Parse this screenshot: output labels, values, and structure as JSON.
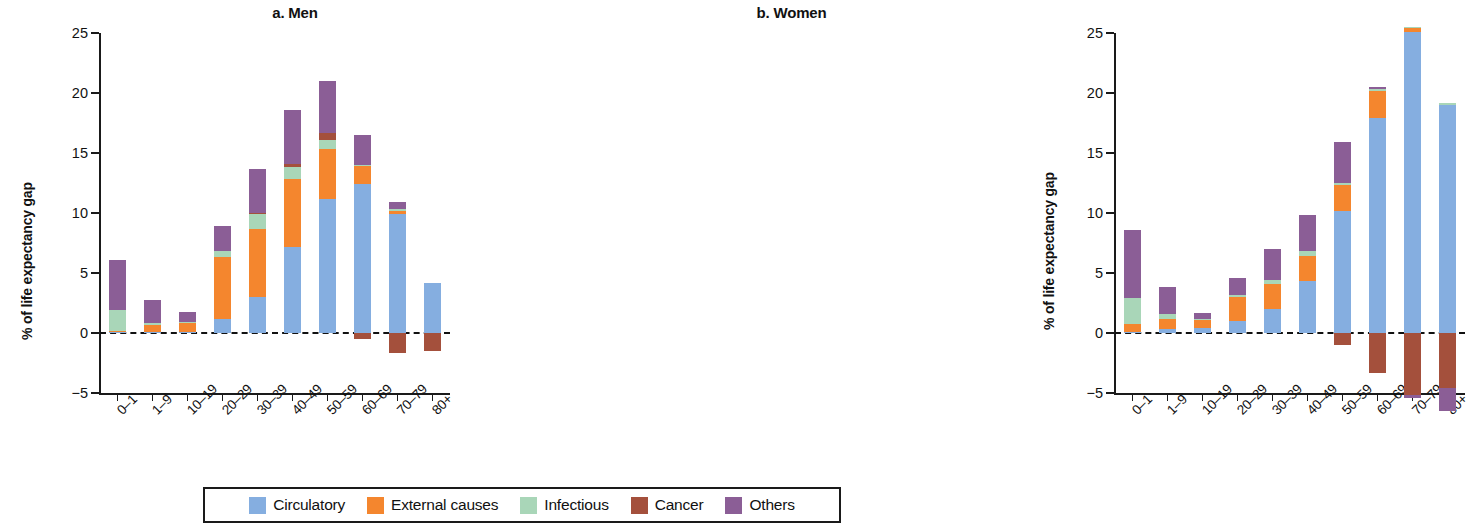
{
  "figure": {
    "ylabel": "% of life expectancy gap"
  },
  "legend": {
    "items": [
      {
        "label": "Circulatory",
        "key": "circulatory",
        "color": "#85AEE0"
      },
      {
        "label": "External causes",
        "key": "external",
        "color": "#F4862E"
      },
      {
        "label": "Infectious",
        "key": "infectious",
        "color": "#A9D6B8"
      },
      {
        "label": "Cancer",
        "key": "cancer",
        "color": "#A4503C"
      },
      {
        "label": "Others",
        "key": "others",
        "color": "#8B5E96"
      }
    ]
  },
  "chart_data": [
    {
      "type": "bar",
      "title": "a. Men",
      "stacked": true,
      "xlabel": "",
      "ylabel": "% of life expectancy gap",
      "ylim": [
        -5,
        25
      ],
      "yticks": [
        25,
        20,
        15,
        10,
        5,
        0,
        -5
      ],
      "yticklabels": [
        "25",
        "20",
        "15",
        "10",
        "5",
        "0",
        "−5"
      ],
      "grid": false,
      "zero_line": true,
      "legend_position": "bottom",
      "categories": [
        "0–1",
        "1–9",
        "10–19",
        "20–29",
        "30–39",
        "40–49",
        "50–59",
        "60–69",
        "70–79",
        "80+"
      ],
      "series": [
        {
          "name": "Circulatory",
          "color": "#85AEE0",
          "values": [
            0.05,
            0.05,
            0.05,
            1.2,
            3.0,
            7.2,
            11.2,
            12.4,
            9.9,
            4.2
          ]
        },
        {
          "name": "External causes",
          "color": "#F4862E",
          "values": [
            0.1,
            0.6,
            0.8,
            5.1,
            5.7,
            5.6,
            4.1,
            1.5,
            0.3,
            0.0
          ]
        },
        {
          "name": "Infectious",
          "color": "#A9D6B8",
          "values": [
            1.8,
            0.2,
            0.1,
            0.5,
            1.2,
            1.0,
            0.8,
            0.1,
            0.1,
            0.0
          ]
        },
        {
          "name": "Cancer",
          "color": "#A4503C",
          "values": [
            0.0,
            0.0,
            0.0,
            0.0,
            0.1,
            0.3,
            0.6,
            -0.5,
            -1.7,
            -1.5
          ]
        },
        {
          "name": "Others",
          "color": "#8B5E96",
          "values": [
            4.1,
            1.9,
            0.8,
            2.1,
            3.7,
            4.5,
            4.3,
            2.5,
            0.6,
            0.0
          ]
        }
      ],
      "totals_positive": [
        6.05,
        2.85,
        1.75,
        8.9,
        13.7,
        18.6,
        21.0,
        16.5,
        10.9,
        4.2
      ]
    },
    {
      "type": "bar",
      "title": "b. Women",
      "stacked": true,
      "xlabel": "",
      "ylabel": "% of life expectancy gap",
      "ylim": [
        -5,
        25
      ],
      "yticks": [
        25,
        20,
        15,
        10,
        5,
        0,
        -5
      ],
      "yticklabels": [
        "25",
        "20",
        "15",
        "10",
        "5",
        "0",
        "−5"
      ],
      "grid": false,
      "zero_line": true,
      "legend_position": "bottom",
      "categories": [
        "0–1",
        "1–9",
        "10–19",
        "20–29",
        "30–39",
        "40–49",
        "50–59",
        "60–69",
        "70–79",
        "80+"
      ],
      "series": [
        {
          "name": "Circulatory",
          "color": "#85AEE0",
          "values": [
            0.05,
            0.3,
            0.4,
            1.0,
            2.0,
            4.3,
            10.2,
            17.9,
            25.1,
            19.0
          ]
        },
        {
          "name": "External causes",
          "color": "#F4862E",
          "values": [
            0.7,
            0.9,
            0.7,
            2.0,
            2.1,
            2.1,
            2.1,
            2.3,
            0.3,
            0.0
          ]
        },
        {
          "name": "Infectious",
          "color": "#A9D6B8",
          "values": [
            2.2,
            0.4,
            0.1,
            0.2,
            0.3,
            0.4,
            0.2,
            0.1,
            0.1,
            0.2
          ]
        },
        {
          "name": "Cancer",
          "color": "#A4503C",
          "values": [
            0.0,
            0.0,
            0.0,
            0.0,
            0.0,
            0.0,
            -1.0,
            -3.3,
            -5.2,
            -4.6
          ]
        },
        {
          "name": "Others",
          "color": "#8B5E96",
          "values": [
            5.6,
            2.2,
            0.5,
            1.4,
            2.6,
            3.0,
            3.4,
            0.2,
            -0.2,
            -1.9
          ]
        }
      ],
      "totals_positive": [
        8.55,
        3.8,
        1.7,
        4.6,
        7.0,
        9.8,
        15.9,
        20.5,
        25.5,
        19.2
      ]
    }
  ]
}
